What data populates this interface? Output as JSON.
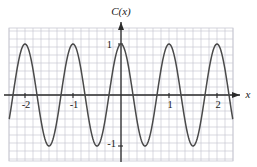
{
  "figure": {
    "function_label": "C(x)",
    "x_axis_label": "x",
    "background_color": "#ffffff",
    "curve_color": "#4a4a4a",
    "axis_color": "#2b2b2b",
    "minor_grid_color": "#c9c9d2",
    "major_grid_color": "#c9c9d2"
  },
  "x_ticks": [
    {
      "value": -2,
      "label": "-2"
    },
    {
      "value": -1,
      "label": "-1"
    },
    {
      "value": 1,
      "label": "1"
    },
    {
      "value": 2,
      "label": "2"
    }
  ],
  "y_ticks": [
    {
      "value": 1,
      "label": "1"
    },
    {
      "value": -1,
      "label": "-1"
    }
  ],
  "chart_data": {
    "type": "line",
    "title": "",
    "subtitle": "",
    "xlabel": "x",
    "ylabel": "C(x)",
    "legend": [],
    "legend_position": "none",
    "grid": true,
    "xlim": [
      -2.35,
      2.35
    ],
    "ylim": [
      -1.42,
      1.05
    ],
    "x_tick_labels": [
      "-2",
      "-1",
      "1",
      "2"
    ],
    "x_tick_values": [
      -2,
      -1,
      1,
      2
    ],
    "y_tick_labels": [
      "1",
      "-1"
    ],
    "y_tick_values": [
      1,
      -1
    ],
    "series": [
      {
        "name": "C(x)",
        "expression": "cos(2*pi*x)",
        "amplitude": 1,
        "period": 1,
        "x": [
          -2.35,
          -2.25,
          -2.15,
          -2.05,
          -2.0,
          -1.9,
          -1.8,
          -1.75,
          -1.7,
          -1.6,
          -1.5,
          -1.4,
          -1.3,
          -1.25,
          -1.2,
          -1.1,
          -1.0,
          -0.9,
          -0.8,
          -0.75,
          -0.7,
          -0.6,
          -0.5,
          -0.4,
          -0.3,
          -0.25,
          -0.2,
          -0.1,
          0.0,
          0.1,
          0.2,
          0.25,
          0.3,
          0.4,
          0.5,
          0.6,
          0.7,
          0.75,
          0.8,
          0.9,
          1.0,
          1.1,
          1.2,
          1.25,
          1.3,
          1.4,
          1.5,
          1.6,
          1.7,
          1.75,
          1.8,
          1.9,
          2.0,
          2.05,
          2.15,
          2.25,
          2.35
        ],
        "y": [
          0.891,
          0.998,
          0.891,
          0.588,
          1.0,
          0.809,
          0.309,
          0.0,
          -0.309,
          -0.809,
          -1.0,
          -0.809,
          -0.309,
          0.0,
          0.309,
          0.809,
          1.0,
          0.809,
          0.309,
          0.0,
          -0.309,
          -0.809,
          -1.0,
          -0.809,
          -0.309,
          0.0,
          0.309,
          0.809,
          1.0,
          0.809,
          0.309,
          0.0,
          -0.309,
          -0.809,
          -1.0,
          -0.809,
          -0.309,
          0.0,
          0.309,
          0.809,
          1.0,
          0.809,
          0.309,
          0.0,
          -0.309,
          -0.809,
          -1.0,
          -0.809,
          -0.309,
          0.0,
          0.309,
          0.809,
          1.0,
          0.951,
          0.454,
          -0.454,
          -0.891
        ],
        "maxima_x": [
          -2.0,
          -1.0,
          0.0,
          1.0,
          2.0
        ],
        "maxima_y": 1,
        "minima_x": [
          -1.5,
          -0.5,
          0.5,
          1.5
        ],
        "minima_y": -1,
        "zeros_x": [
          -2.25,
          -1.75,
          -1.25,
          -0.75,
          -0.25,
          0.25,
          0.75,
          1.25,
          1.75,
          2.25
        ]
      }
    ]
  }
}
